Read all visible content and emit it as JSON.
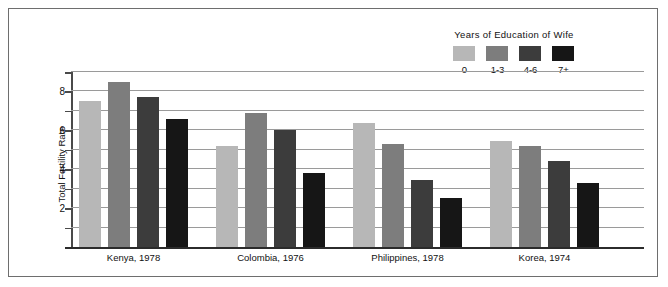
{
  "chart_data": {
    "type": "bar",
    "title": "",
    "xlabel": "",
    "ylabel": "Total Fertility Rate",
    "ylim": [
      0,
      9
    ],
    "yticks": [
      2,
      4,
      6,
      8
    ],
    "gridlines": [
      1,
      2,
      3,
      4,
      5,
      6,
      7,
      8,
      9
    ],
    "grid": true,
    "legend_title": "Years of Education of Wife",
    "legend_position": "top-right",
    "categories": [
      "Kenya, 1978",
      "Colombia, 1976",
      "Philippines, 1978",
      "Korea, 1974"
    ],
    "series": [
      {
        "name": "0",
        "color": "#b7b7b7",
        "values": [
          7.5,
          5.2,
          6.4,
          5.45
        ]
      },
      {
        "name": "1-3",
        "color": "#7d7d7d",
        "values": [
          8.5,
          6.9,
          5.3,
          5.2
        ]
      },
      {
        "name": "4-6",
        "color": "#3c3c3c",
        "values": [
          7.7,
          6.0,
          3.45,
          4.4
        ]
      },
      {
        "name": "7+",
        "color": "#161616",
        "values": [
          6.6,
          3.8,
          2.5,
          3.3
        ]
      }
    ]
  },
  "colors": {
    "frame": "#6e6e6e",
    "gridline": "#9a9a9a",
    "axis": "#4a4a4a",
    "baseline": "#2b2b2b"
  }
}
